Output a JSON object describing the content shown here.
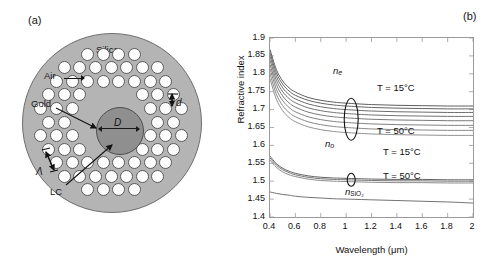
{
  "panels": {
    "a": {
      "letter": "(a)"
    },
    "b": {
      "letter": "(b)"
    }
  },
  "diagram": {
    "name": "photonic-crystal-fiber-cross-section",
    "region_labels": {
      "silica": "Silica",
      "air": "Air",
      "gold": "Gold",
      "lc": "LC"
    },
    "dimension_labels": {
      "core_diameter": "D",
      "hole_diameter": "d",
      "pitch": "Λ"
    },
    "axes_labels": {
      "y": "y",
      "x": "x",
      "z": "z",
      "phi": "φ"
    },
    "colors": {
      "cladding_fill": "#b4b4b4",
      "core_fill": "#8f8f8f",
      "hole_fill": "#fdfdfd",
      "outline": "#5a5a5a"
    }
  },
  "chart_data": {
    "type": "line",
    "title": "",
    "xlabel": "Wavelength (μm)",
    "ylabel": "Refractive index",
    "xlim": [
      0.4,
      2
    ],
    "ylim": [
      1.4,
      1.9
    ],
    "xticks": [
      "0.4",
      "0.6",
      "0.8",
      "1",
      "1.2",
      "1.4",
      "1.6",
      "1.8",
      "2"
    ],
    "xtick_values": [
      0.4,
      0.6,
      0.8,
      1.0,
      1.2,
      1.4,
      1.6,
      1.8,
      2.0
    ],
    "yticks": [
      "1.4",
      "1.45",
      "1.5",
      "1.55",
      "1.6",
      "1.65",
      "1.7",
      "1.75",
      "1.8",
      "1.85",
      "1.9"
    ],
    "ytick_values": [
      1.4,
      1.45,
      1.5,
      1.55,
      1.6,
      1.65,
      1.7,
      1.75,
      1.8,
      1.85,
      1.9
    ],
    "grid": false,
    "legend_position": "inline-annotations",
    "annotations": [
      {
        "text": "n_e",
        "display": "n",
        "sub": "e",
        "x": 1.02,
        "y": 1.745
      },
      {
        "text": "n_o",
        "display": "n",
        "sub": "o",
        "x": 1.0,
        "y": 1.535
      },
      {
        "text": "n_SiO2",
        "display": "n",
        "sub": "SiO₂",
        "x": 1.12,
        "y": 1.432
      },
      {
        "text": "T = 15°C",
        "x": 1.62,
        "y": 1.718
      },
      {
        "text": "T = 50°C",
        "x": 1.62,
        "y": 1.6
      },
      {
        "text": "T = 15°C",
        "x": 1.68,
        "y": 1.537
      },
      {
        "text": "T = 50°C",
        "x": 1.68,
        "y": 1.473
      }
    ],
    "series": [
      {
        "name": "n_e T=15C",
        "color": "#555555",
        "x": [
          0.4,
          0.45,
          0.5,
          0.55,
          0.6,
          0.7,
          0.8,
          0.9,
          1.0,
          1.2,
          1.4,
          1.6,
          1.8,
          2.0
        ],
        "values": [
          1.868,
          1.812,
          1.78,
          1.761,
          1.749,
          1.734,
          1.726,
          1.721,
          1.718,
          1.714,
          1.712,
          1.711,
          1.71,
          1.71
        ]
      },
      {
        "name": "n_e T=20C",
        "color": "#5c5c5c",
        "x": [
          0.4,
          0.45,
          0.5,
          0.55,
          0.6,
          0.7,
          0.8,
          0.9,
          1.0,
          1.2,
          1.4,
          1.6,
          1.8,
          2.0
        ],
        "values": [
          1.859,
          1.803,
          1.771,
          1.752,
          1.74,
          1.726,
          1.718,
          1.713,
          1.71,
          1.706,
          1.704,
          1.703,
          1.702,
          1.702
        ]
      },
      {
        "name": "n_e T=25C",
        "color": "#636363",
        "x": [
          0.4,
          0.45,
          0.5,
          0.55,
          0.6,
          0.7,
          0.8,
          0.9,
          1.0,
          1.2,
          1.4,
          1.6,
          1.8,
          2.0
        ],
        "values": [
          1.849,
          1.793,
          1.761,
          1.742,
          1.73,
          1.716,
          1.708,
          1.703,
          1.7,
          1.696,
          1.694,
          1.693,
          1.692,
          1.692
        ]
      },
      {
        "name": "n_e T=30C",
        "color": "#6b6b6b",
        "x": [
          0.4,
          0.45,
          0.5,
          0.55,
          0.6,
          0.7,
          0.8,
          0.9,
          1.0,
          1.2,
          1.4,
          1.6,
          1.8,
          2.0
        ],
        "values": [
          1.838,
          1.782,
          1.75,
          1.731,
          1.719,
          1.705,
          1.697,
          1.692,
          1.689,
          1.685,
          1.683,
          1.682,
          1.681,
          1.681
        ]
      },
      {
        "name": "n_e T=35C",
        "color": "#727272",
        "x": [
          0.4,
          0.45,
          0.5,
          0.55,
          0.6,
          0.7,
          0.8,
          0.9,
          1.0,
          1.2,
          1.4,
          1.6,
          1.8,
          2.0
        ],
        "values": [
          1.826,
          1.77,
          1.738,
          1.719,
          1.707,
          1.693,
          1.685,
          1.68,
          1.677,
          1.673,
          1.671,
          1.67,
          1.669,
          1.669
        ]
      },
      {
        "name": "n_e T=40C",
        "color": "#7a7a7a",
        "x": [
          0.4,
          0.45,
          0.5,
          0.55,
          0.6,
          0.7,
          0.8,
          0.9,
          1.0,
          1.2,
          1.4,
          1.6,
          1.8,
          2.0
        ],
        "values": [
          1.814,
          1.757,
          1.725,
          1.706,
          1.694,
          1.68,
          1.672,
          1.667,
          1.664,
          1.66,
          1.658,
          1.657,
          1.656,
          1.656
        ]
      },
      {
        "name": "n_e T=45C",
        "color": "#828282",
        "x": [
          0.4,
          0.45,
          0.5,
          0.55,
          0.6,
          0.7,
          0.8,
          0.9,
          1.0,
          1.2,
          1.4,
          1.6,
          1.8,
          2.0
        ],
        "values": [
          1.8,
          1.743,
          1.711,
          1.692,
          1.68,
          1.666,
          1.658,
          1.653,
          1.65,
          1.646,
          1.644,
          1.643,
          1.642,
          1.642
        ]
      },
      {
        "name": "n_e T=50C",
        "color": "#8a8a8a",
        "x": [
          0.4,
          0.45,
          0.5,
          0.55,
          0.6,
          0.7,
          0.8,
          0.9,
          1.0,
          1.2,
          1.4,
          1.6,
          1.8,
          2.0
        ],
        "values": [
          1.786,
          1.729,
          1.697,
          1.678,
          1.666,
          1.652,
          1.644,
          1.639,
          1.636,
          1.632,
          1.63,
          1.629,
          1.628,
          1.628
        ]
      },
      {
        "name": "n_o T=15C",
        "color": "#5a5a5a",
        "x": [
          0.4,
          0.45,
          0.5,
          0.55,
          0.6,
          0.7,
          0.8,
          0.9,
          1.0,
          1.2,
          1.4,
          1.6,
          1.8,
          2.0
        ],
        "values": [
          1.57,
          1.549,
          1.536,
          1.528,
          1.522,
          1.515,
          1.511,
          1.509,
          1.508,
          1.506,
          1.505,
          1.505,
          1.504,
          1.504
        ]
      },
      {
        "name": "n_o T=30C",
        "color": "#6f6f6f",
        "x": [
          0.4,
          0.45,
          0.5,
          0.55,
          0.6,
          0.7,
          0.8,
          0.9,
          1.0,
          1.2,
          1.4,
          1.6,
          1.8,
          2.0
        ],
        "values": [
          1.565,
          1.545,
          1.532,
          1.524,
          1.518,
          1.511,
          1.507,
          1.505,
          1.504,
          1.502,
          1.501,
          1.501,
          1.5,
          1.5
        ]
      },
      {
        "name": "n_o T=50C",
        "color": "#858585",
        "x": [
          0.4,
          0.45,
          0.5,
          0.55,
          0.6,
          0.7,
          0.8,
          0.9,
          1.0,
          1.2,
          1.4,
          1.6,
          1.8,
          2.0
        ],
        "values": [
          1.559,
          1.539,
          1.526,
          1.518,
          1.513,
          1.506,
          1.502,
          1.5,
          1.499,
          1.497,
          1.496,
          1.496,
          1.495,
          1.495
        ]
      },
      {
        "name": "n_SiO2",
        "color": "#6a6a6a",
        "x": [
          0.4,
          0.45,
          0.5,
          0.55,
          0.6,
          0.7,
          0.8,
          0.9,
          1.0,
          1.2,
          1.4,
          1.6,
          1.8,
          2.0
        ],
        "values": [
          1.47,
          1.466,
          1.463,
          1.461,
          1.458,
          1.455,
          1.453,
          1.451,
          1.45,
          1.448,
          1.446,
          1.444,
          1.442,
          1.439
        ]
      }
    ]
  }
}
